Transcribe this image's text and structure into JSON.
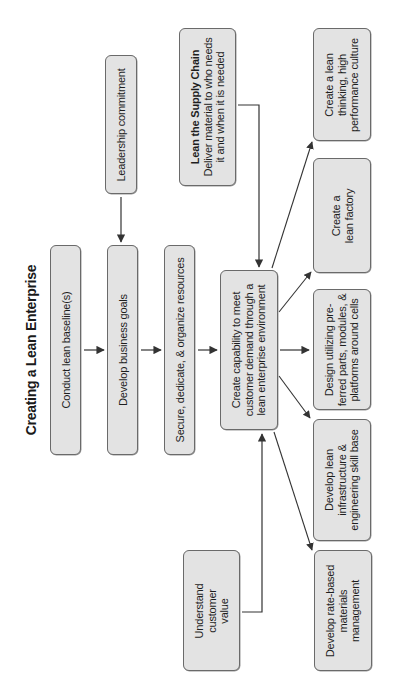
{
  "title": "Creating a Lean Enterprise",
  "orientation": "rotated 90° counter-clockwise (text reads bottom-to-top)",
  "nodes": {
    "conduct_baseline": {
      "lines": [
        "Conduct lean baseline(s)"
      ]
    },
    "business_goals": {
      "lines": [
        "Develop business goals"
      ]
    },
    "organize_resources": {
      "lines": [
        "Secure, dedicate, & organize resources"
      ]
    },
    "leadership": {
      "lines": [
        "Leadership commitment"
      ]
    },
    "supply_chain": {
      "heading": "Lean the Supply Chain",
      "lines": [
        "Deliver material to who needs",
        "it and when it is needed"
      ]
    },
    "create_capability": {
      "lines": [
        "Create capability to meet",
        "customer demand through a",
        "lean enterprise environment"
      ]
    },
    "customer_value": {
      "lines": [
        "Understand",
        "customer",
        "value"
      ]
    },
    "lean_culture": {
      "lines": [
        "Create a lean",
        "thinking, high",
        "performance culture"
      ]
    },
    "lean_factory": {
      "lines": [
        "Create a",
        "lean factory"
      ]
    },
    "design_preferred": {
      "lines": [
        "Design utilizing pre-",
        "ferred parts, modules, &",
        "platforms around cells"
      ]
    },
    "lean_infrastructure": {
      "lines": [
        "Develop lean",
        "infrastructure &",
        "engineering skill base"
      ]
    },
    "rate_based": {
      "lines": [
        "Develop rate-based",
        "materials",
        "management"
      ]
    }
  },
  "edges": [
    {
      "from": "conduct_baseline",
      "to": "business_goals"
    },
    {
      "from": "leadership",
      "to": "business_goals"
    },
    {
      "from": "business_goals",
      "to": "organize_resources"
    },
    {
      "from": "organize_resources",
      "to": "create_capability"
    },
    {
      "from": "supply_chain",
      "to": "create_capability"
    },
    {
      "from": "customer_value",
      "to": "create_capability"
    },
    {
      "from": "create_capability",
      "to": "lean_culture"
    },
    {
      "from": "create_capability",
      "to": "lean_factory"
    },
    {
      "from": "create_capability",
      "to": "design_preferred"
    },
    {
      "from": "create_capability",
      "to": "lean_infrastructure"
    },
    {
      "from": "create_capability",
      "to": "rate_based"
    }
  ],
  "colors": {
    "box_fill": "#e3e3e3",
    "box_border": "#6a6a6a",
    "connector": "#333333",
    "text": "#1e1e1e"
  }
}
